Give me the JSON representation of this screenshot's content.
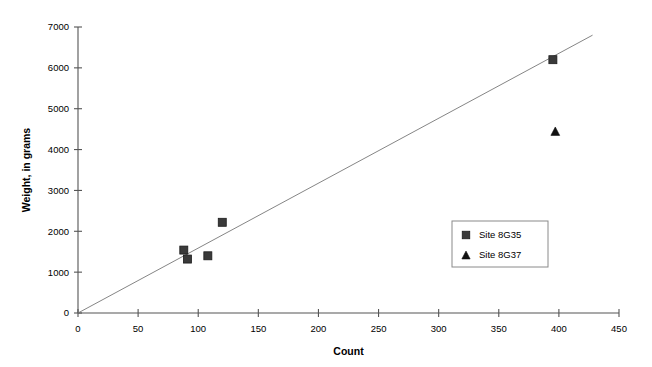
{
  "chart_data": {
    "type": "scatter",
    "title": "",
    "xlabel": "Count",
    "ylabel": "Weight, in grams",
    "xlim": [
      0,
      450
    ],
    "ylim": [
      0,
      7000
    ],
    "xticks": [
      0,
      50,
      100,
      150,
      200,
      250,
      300,
      350,
      400,
      450
    ],
    "yticks": [
      0,
      1000,
      2000,
      3000,
      4000,
      5000,
      6000,
      7000
    ],
    "xtick_labels": [
      "0",
      "50",
      "100",
      "150",
      "200",
      "250",
      "300",
      "350",
      "400",
      "450"
    ],
    "ytick_labels": [
      "0",
      "1000",
      "2000",
      "3000",
      "4000",
      "5000",
      "6000",
      "7000"
    ],
    "grid": false,
    "legend_position": "center-right",
    "series": [
      {
        "name": "Site 8G35",
        "marker": "square",
        "color": "#3a3a3a",
        "points": [
          {
            "x": 88,
            "y": 1540
          },
          {
            "x": 91,
            "y": 1320
          },
          {
            "x": 108,
            "y": 1400
          },
          {
            "x": 120,
            "y": 2220
          },
          {
            "x": 395,
            "y": 6200
          }
        ]
      },
      {
        "name": "Site 8G37",
        "marker": "triangle",
        "color": "#111111",
        "points": [
          {
            "x": 397,
            "y": 4450
          }
        ]
      }
    ],
    "trend_line": {
      "name": "linear-fit",
      "color": "#777777",
      "x_start": 0,
      "y_start": 0,
      "x_end": 428,
      "y_end": 6800
    }
  },
  "legend": {
    "entries": [
      {
        "label": "Site 8G35",
        "marker": "square"
      },
      {
        "label": "Site 8G37",
        "marker": "triangle"
      }
    ]
  },
  "axes": {
    "x_title": "Count",
    "y_title": "Weight, in grams"
  }
}
